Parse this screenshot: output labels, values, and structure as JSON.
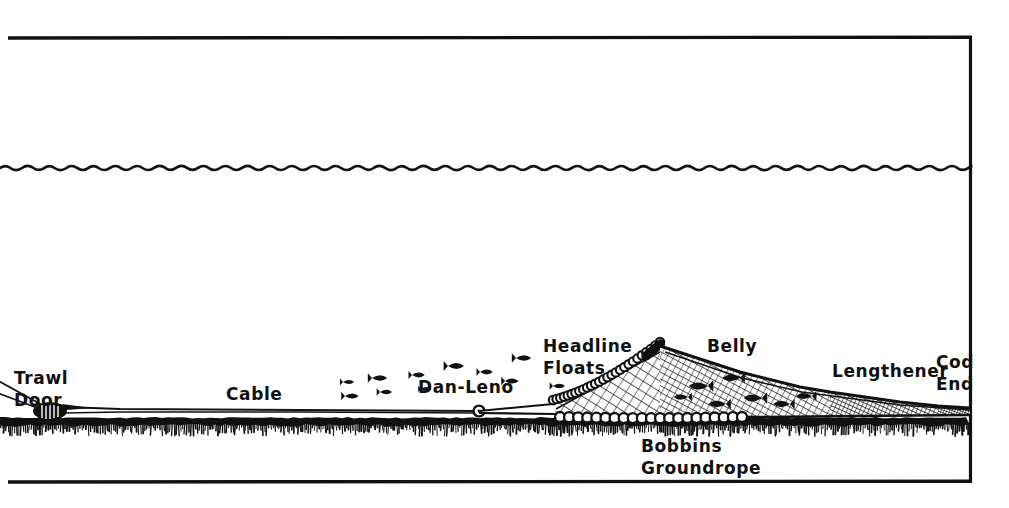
{
  "figure": {
    "style": "hand-drawn-ink-illustration",
    "background_color": "#ffffff",
    "ink_color": "#111111",
    "width": 1009,
    "height": 508
  },
  "frame": {
    "top_rule": {
      "x1": 8,
      "y1": 38,
      "x2": 972,
      "y2": 37
    },
    "bottom_rule": {
      "x1": 8,
      "y1": 482,
      "x2": 972,
      "y2": 481
    },
    "right_rule": {
      "x1": 971,
      "y1": 37,
      "x2": 971,
      "y2": 482
    },
    "left_open": true
  },
  "scene": {
    "water_surface": {
      "name": "sea-surface-wavy-line",
      "y": 168,
      "x_start": 0,
      "x_end": 970,
      "wave_amplitude": 4,
      "wave_period": 11
    },
    "seabed": {
      "name": "sea-floor",
      "y": 418,
      "x_start": 0,
      "x_end": 970,
      "band_thickness": 7,
      "hatch_depth": 12
    }
  },
  "labels": [
    {
      "id": "trawl-door",
      "lines": [
        "Trawl",
        "Door"
      ],
      "x": 14,
      "y": 384,
      "anchor": "start",
      "size": 17
    },
    {
      "id": "cable",
      "lines": [
        "Cable"
      ],
      "x": 226,
      "y": 400,
      "anchor": "start",
      "size": 17
    },
    {
      "id": "dan-leno",
      "lines": [
        "Dan-Leno"
      ],
      "x": 418,
      "y": 393,
      "anchor": "start",
      "size": 17
    },
    {
      "id": "headline-floats",
      "lines": [
        "Headline",
        "Floats"
      ],
      "x": 543,
      "y": 352,
      "anchor": "start",
      "size": 17
    },
    {
      "id": "belly",
      "lines": [
        "Belly"
      ],
      "x": 707,
      "y": 352,
      "anchor": "start",
      "size": 17
    },
    {
      "id": "lengthener",
      "lines": [
        "Lengthener"
      ],
      "x": 832,
      "y": 377,
      "anchor": "start",
      "size": 17
    },
    {
      "id": "cod-end",
      "lines": [
        "Cod",
        "End"
      ],
      "x": 936,
      "y": 368,
      "anchor": "start",
      "size": 17
    },
    {
      "id": "bobbins-groundrope",
      "lines": [
        "Bobbins",
        "Groundrope"
      ],
      "x": 641,
      "y": 452,
      "anchor": "start",
      "size": 17
    }
  ],
  "gear": {
    "warp_cable": {
      "name": "towing-warp-cable",
      "points": [
        [
          0,
          384
        ],
        [
          40,
          404
        ],
        [
          478,
          411
        ]
      ]
    },
    "trawl_door": {
      "name": "otter-trawl-door",
      "x": 37,
      "y": 409,
      "width": 28,
      "height": 17
    },
    "dan_leno_bobbin": {
      "name": "dan-leno-bobbin",
      "x": 479,
      "y": 411,
      "r": 5
    },
    "upper_wing_line": {
      "name": "headline-wing-rope",
      "points": [
        [
          479,
          411
        ],
        [
          552,
          404
        ],
        [
          660,
          346
        ]
      ]
    },
    "lower_wing_line": {
      "name": "groundrope-wing",
      "points": [
        [
          479,
          413
        ],
        [
          560,
          414
        ],
        [
          660,
          415
        ]
      ]
    },
    "headline": {
      "name": "headline-with-floats",
      "points": [
        [
          553,
          404
        ],
        [
          600,
          386
        ],
        [
          630,
          366
        ],
        [
          660,
          346
        ]
      ],
      "float_count": 26,
      "float_radius": 4.2
    },
    "net_top_edge": {
      "name": "net-belly-top-profile",
      "points": [
        [
          660,
          346
        ],
        [
          740,
          372
        ],
        [
          820,
          391
        ],
        [
          900,
          402
        ],
        [
          970,
          408
        ]
      ]
    },
    "net_bottom_edge": {
      "name": "net-lower-profile",
      "points": [
        [
          660,
          416
        ],
        [
          760,
          417
        ],
        [
          860,
          416
        ],
        [
          970,
          415
        ]
      ]
    },
    "groundrope": {
      "name": "bobbin-groundrope",
      "y": 417,
      "x_start": 560,
      "x_end": 742,
      "bobbin_count": 20,
      "bobbin_radius": 5
    },
    "fish_in_net": {
      "name": "fish-entering-net",
      "count": 7
    },
    "fish_in_water": {
      "name": "free-swimming-fish-school",
      "count": 11
    }
  },
  "chart_data": {
    "type": "diagram",
    "components": [
      "Trawl Door",
      "Cable",
      "Dan-Leno",
      "Headline Floats",
      "Belly",
      "Lengthener",
      "Cod End",
      "Bobbins Groundrope"
    ]
  }
}
